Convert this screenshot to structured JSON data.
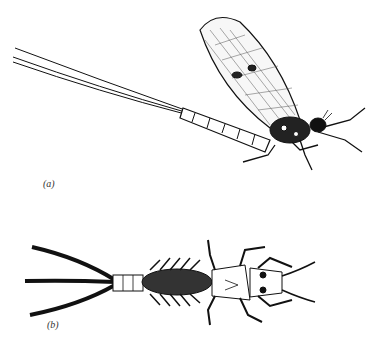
{
  "figure": {
    "panels": [
      {
        "label": "(a)",
        "subject": "adult mayfly (side view)"
      },
      {
        "label": "(b)",
        "subject": "mayfly nymph (dorsal view)"
      }
    ],
    "colors": {
      "ink": "#111111",
      "background": "#ffffff"
    }
  }
}
